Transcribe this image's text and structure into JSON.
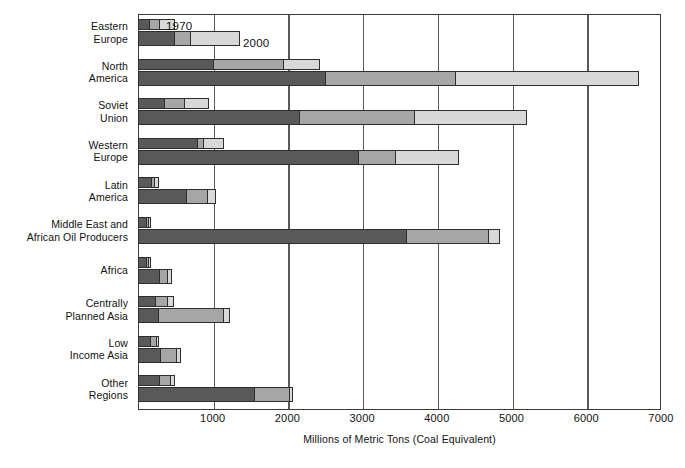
{
  "chart_data": {
    "type": "bar",
    "orientation": "horizontal",
    "title": "",
    "xlabel": "Millions of Metric Tons (Coal Equivalent)",
    "ylabel": "",
    "xlim": [
      0,
      7000
    ],
    "xticks": [
      1000,
      2000,
      3000,
      4000,
      5000,
      6000,
      7000
    ],
    "grid": true,
    "legend": "inline",
    "stacked": true,
    "series_labels": [
      "1970",
      "2000"
    ],
    "segment_shades": [
      "#595959",
      "#a6a6a6",
      "#d8d8d8"
    ],
    "categories": [
      "Eastern\nEurope",
      "North\nAmerica",
      "Soviet\nUnion",
      "Western\nEurope",
      "Latin\nAmerica",
      "Middle East and\nAfrican Oil Producers",
      "Africa",
      "Centrally\nPlanned Asia",
      "Low\nIncome Asia",
      "Other\nRegions"
    ],
    "rows": [
      {
        "category": "Eastern Europe",
        "bars": [
          {
            "year": "1970",
            "segments": [
              140,
              150,
              200
            ],
            "total": 490
          },
          {
            "year": "2000",
            "segments": [
              480,
              220,
              670
            ],
            "total": 1370
          }
        ]
      },
      {
        "category": "North America",
        "bars": [
          {
            "year": "1970",
            "segments": [
              1000,
              950,
              480
            ],
            "total": 2430
          },
          {
            "year": "2000",
            "segments": [
              2500,
              1750,
              2450
            ],
            "total": 6700
          }
        ]
      },
      {
        "category": "Soviet Union",
        "bars": [
          {
            "year": "1970",
            "segments": [
              350,
              270,
              330
            ],
            "total": 950
          },
          {
            "year": "2000",
            "segments": [
              2150,
              1550,
              1500
            ],
            "total": 5200
          }
        ]
      },
      {
        "category": "Western Europe",
        "bars": [
          {
            "year": "1970",
            "segments": [
              800,
              80,
              270
            ],
            "total": 1150
          },
          {
            "year": "2000",
            "segments": [
              2950,
              500,
              850
            ],
            "total": 4300
          }
        ]
      },
      {
        "category": "Latin America",
        "bars": [
          {
            "year": "1970",
            "segments": [
              180,
              50,
              50
            ],
            "total": 280
          },
          {
            "year": "2000",
            "segments": [
              650,
              280,
              110
            ],
            "total": 1040
          }
        ]
      },
      {
        "category": "Middle East and African Oil Producers",
        "bars": [
          {
            "year": "1970",
            "segments": [
              110,
              40,
              30
            ],
            "total": 180
          },
          {
            "year": "2000",
            "segments": [
              3600,
              1100,
              150
            ],
            "total": 4850
          }
        ]
      },
      {
        "category": "Africa",
        "bars": [
          {
            "year": "1970",
            "segments": [
              110,
              30,
              30
            ],
            "total": 170
          },
          {
            "year": "2000",
            "segments": [
              280,
              120,
              50
            ],
            "total": 450
          }
        ]
      },
      {
        "category": "Centrally Planned Asia",
        "bars": [
          {
            "year": "1970",
            "segments": [
              230,
              170,
              80
            ],
            "total": 480
          },
          {
            "year": "2000",
            "segments": [
              260,
              890,
              80
            ],
            "total": 1230
          }
        ]
      },
      {
        "category": "Low Income Asia",
        "bars": [
          {
            "year": "1970",
            "segments": [
              170,
              80,
              30
            ],
            "total": 280
          },
          {
            "year": "2000",
            "segments": [
              300,
              220,
              60
            ],
            "total": 580
          }
        ]
      },
      {
        "category": "Other Regions",
        "bars": [
          {
            "year": "1970",
            "segments": [
              290,
              150,
              50
            ],
            "total": 490
          },
          {
            "year": "2000",
            "segments": [
              1560,
              470,
              50
            ],
            "total": 2080
          }
        ]
      }
    ]
  },
  "axis": {
    "tick_labels": [
      "1000",
      "2000",
      "3000",
      "4000",
      "5000",
      "6000",
      "7000"
    ],
    "title": "Millions of Metric Tons (Coal Equivalent)"
  },
  "annotations": {
    "label_1970": "1970",
    "label_2000": "2000"
  }
}
